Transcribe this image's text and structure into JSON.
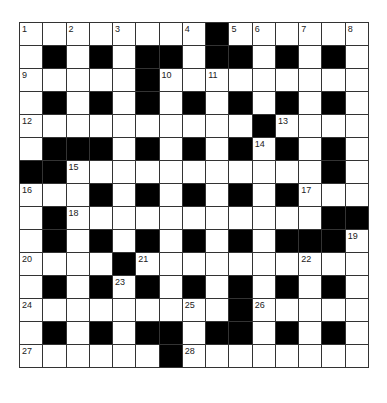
{
  "puzzle": {
    "rows": 15,
    "cols": 15,
    "colors": {
      "block": "#000000",
      "cell": "#ffffff",
      "grid_line": "#333333",
      "number": "#222222"
    },
    "grid": [
      [
        "1",
        "W",
        "2",
        "W",
        "3",
        "W",
        "W",
        "4",
        "B",
        "5",
        "6",
        "W",
        "7",
        "W",
        "8"
      ],
      [
        "W",
        "B",
        "W",
        "B",
        "W",
        "B",
        "B",
        "W",
        "B",
        "B",
        "W",
        "B",
        "W",
        "B",
        "W"
      ],
      [
        "9",
        "W",
        "W",
        "W",
        "W",
        "B",
        "10",
        "W",
        "11",
        "W",
        "W",
        "W",
        "W",
        "W",
        "W"
      ],
      [
        "W",
        "B",
        "W",
        "B",
        "W",
        "B",
        "W",
        "B",
        "W",
        "B",
        "W",
        "B",
        "W",
        "B",
        "W"
      ],
      [
        "12",
        "W",
        "W",
        "W",
        "W",
        "W",
        "W",
        "W",
        "W",
        "W",
        "B",
        "13",
        "W",
        "W",
        "W"
      ],
      [
        "W",
        "B",
        "B",
        "B",
        "W",
        "B",
        "W",
        "B",
        "W",
        "B",
        "14",
        "B",
        "W",
        "B",
        "W"
      ],
      [
        "B",
        "B",
        "15",
        "W",
        "W",
        "W",
        "W",
        "W",
        "W",
        "W",
        "W",
        "W",
        "W",
        "B",
        "W"
      ],
      [
        "16",
        "W",
        "W",
        "B",
        "W",
        "B",
        "W",
        "B",
        "W",
        "B",
        "W",
        "B",
        "17",
        "W",
        "W"
      ],
      [
        "W",
        "B",
        "18",
        "W",
        "W",
        "W",
        "W",
        "W",
        "W",
        "W",
        "W",
        "W",
        "W",
        "B",
        "B"
      ],
      [
        "W",
        "B",
        "W",
        "B",
        "W",
        "B",
        "W",
        "B",
        "W",
        "B",
        "W",
        "B",
        "B",
        "B",
        "19"
      ],
      [
        "20",
        "W",
        "W",
        "W",
        "B",
        "21",
        "W",
        "W",
        "W",
        "W",
        "W",
        "W",
        "22",
        "W",
        "W"
      ],
      [
        "W",
        "B",
        "W",
        "B",
        "23",
        "B",
        "W",
        "B",
        "W",
        "B",
        "W",
        "B",
        "W",
        "B",
        "W"
      ],
      [
        "24",
        "W",
        "W",
        "W",
        "W",
        "W",
        "W",
        "25",
        "W",
        "B",
        "26",
        "W",
        "W",
        "W",
        "W"
      ],
      [
        "W",
        "B",
        "W",
        "B",
        "W",
        "B",
        "B",
        "W",
        "B",
        "B",
        "W",
        "B",
        "W",
        "B",
        "W"
      ],
      [
        "27",
        "W",
        "W",
        "W",
        "W",
        "W",
        "B",
        "28",
        "W",
        "W",
        "W",
        "W",
        "W",
        "W",
        "W"
      ]
    ]
  }
}
